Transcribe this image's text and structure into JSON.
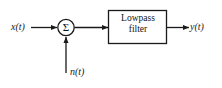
{
  "diagram": {
    "type": "signal-flow-block-diagram",
    "background_color": "#ffffff",
    "line_color": "#1a1a1a",
    "nodes": {
      "input_signal": {
        "label": "x(t)",
        "role": "input"
      },
      "noise_signal": {
        "label": "n(t)",
        "role": "additive-noise-input"
      },
      "summing_junction": {
        "label": "Σ",
        "shape": "circle"
      },
      "filter_block": {
        "label_line_1": "Lowpass",
        "label_line_2": "filter",
        "shape": "rectangle"
      },
      "output_signal": {
        "label": "y(t)",
        "role": "output"
      }
    },
    "edges": [
      {
        "from": "input_signal",
        "to": "summing_junction",
        "direction": "right"
      },
      {
        "from": "noise_signal",
        "to": "summing_junction",
        "direction": "up"
      },
      {
        "from": "summing_junction",
        "to": "filter_block",
        "direction": "right"
      },
      {
        "from": "filter_block",
        "to": "output_signal",
        "direction": "right"
      }
    ]
  }
}
